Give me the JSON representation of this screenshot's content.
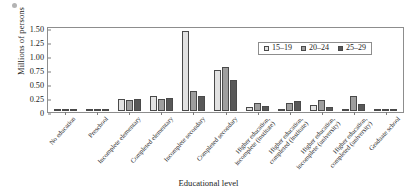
{
  "chart_data": {
    "type": "bar",
    "title": "",
    "xlabel": "Educational level",
    "ylabel": "Millions of persons",
    "ylim": [
      0,
      1.5
    ],
    "yticks": [
      "0",
      "0.25",
      "0.50",
      "0.75",
      "1.00",
      "1.25",
      "1.50"
    ],
    "ytick_values": [
      0,
      0.25,
      0.5,
      0.75,
      1.0,
      1.25,
      1.5
    ],
    "grid": false,
    "legend_position": "top-right-inside",
    "categories": [
      "No education",
      "Preschool",
      "Incomplete elementary",
      "Completed elementary",
      "Incomplete secondary",
      "Completed secondary",
      "Higher education, incomplete (institute)",
      "Higher education, completed (institute)",
      "Higher education, incomplete (university)",
      "Higher education, completed (university)",
      "Graduate school"
    ],
    "category_lines": [
      [
        "No education",
        ""
      ],
      [
        "Preschool",
        ""
      ],
      [
        "Incomplete elementary",
        ""
      ],
      [
        "Completed elementary",
        ""
      ],
      [
        "Incomplete secondary",
        ""
      ],
      [
        "Completed secondary",
        ""
      ],
      [
        "Higher education,",
        "incomplete (institute)"
      ],
      [
        "Higher education,",
        "completed (institute)"
      ],
      [
        "Higher education,",
        "incomplete (university)"
      ],
      [
        "Higher education,",
        "completed (university)"
      ],
      [
        "Graduate school",
        ""
      ]
    ],
    "series": [
      {
        "name": "15–19",
        "color": "#e2e2e2",
        "values": [
          0.02,
          0.01,
          0.21,
          0.26,
          1.42,
          0.73,
          0.07,
          0.01,
          0.11,
          0.02,
          0.0
        ]
      },
      {
        "name": "20–24",
        "color": "#9e9e9e",
        "values": [
          0.02,
          0.01,
          0.19,
          0.21,
          0.36,
          0.78,
          0.15,
          0.15,
          0.19,
          0.27,
          0.01
        ]
      },
      {
        "name": "25–29",
        "color": "#585858",
        "values": [
          0.02,
          0.01,
          0.22,
          0.23,
          0.27,
          0.55,
          0.09,
          0.18,
          0.07,
          0.13,
          0.03
        ]
      }
    ]
  },
  "legend": {
    "items": [
      {
        "label": "15–19"
      },
      {
        "label": "20–24"
      },
      {
        "label": "25–29"
      }
    ]
  }
}
